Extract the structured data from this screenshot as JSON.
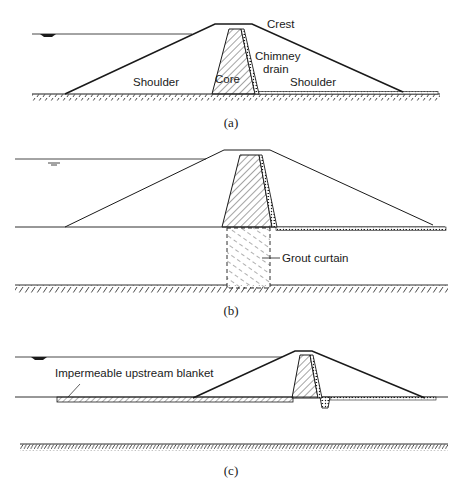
{
  "figure": {
    "panels": [
      {
        "id": "a",
        "caption": "(a)",
        "labels": {
          "crest": "Crest",
          "chimney_drain_line1": "Chimney",
          "chimney_drain_line2": "drain",
          "shoulder_upstream": "Shoulder",
          "core": "Core",
          "shoulder_downstream": "Shoulder"
        }
      },
      {
        "id": "b",
        "caption": "(b)",
        "labels": {
          "grout_curtain": "Grout curtain"
        }
      },
      {
        "id": "c",
        "caption": "(c)",
        "labels": {
          "blanket": "Impermeable upstream blanket"
        }
      }
    ],
    "colors": {
      "line": "#1a1a1a",
      "background": "#ffffff"
    }
  }
}
